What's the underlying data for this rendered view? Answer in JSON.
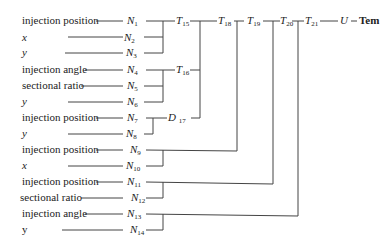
{
  "inputs": [
    {
      "label": "injection position",
      "node": "N",
      "sub": "1"
    },
    {
      "label": "x",
      "node": "N",
      "sub": "2"
    },
    {
      "label": "y",
      "node": "N",
      "sub": "3"
    },
    {
      "label": "injection angle",
      "node": "N",
      "sub": "4"
    },
    {
      "label": "sectional ratio",
      "node": "N",
      "sub": "5"
    },
    {
      "label": "y",
      "node": "N",
      "sub": "6"
    },
    {
      "label": "injection position",
      "node": "N",
      "sub": "7"
    },
    {
      "label": "y",
      "node": "N",
      "sub": "8"
    },
    {
      "label": "injection position",
      "node": "N",
      "sub": "9"
    },
    {
      "label": "x",
      "node": "N",
      "sub": "10"
    },
    {
      "label": "injection position",
      "node": "N",
      "sub": "11"
    },
    {
      "label": "sectional ratio",
      "node": "N",
      "sub": "12"
    },
    {
      "label": "injection angle",
      "node": "N",
      "sub": "13"
    },
    {
      "label": "y",
      "node": "N",
      "sub": "14"
    }
  ],
  "intermediate": [
    {
      "node": "T",
      "sub": "15"
    },
    {
      "node": "T",
      "sub": "16"
    },
    {
      "node": "D",
      "sub": "17"
    },
    {
      "node": "T",
      "sub": "18"
    },
    {
      "node": "T",
      "sub": "19"
    },
    {
      "node": "T",
      "sub": "20"
    },
    {
      "node": "T",
      "sub": "21"
    }
  ],
  "output": {
    "node": "U",
    "label": "Tem"
  }
}
